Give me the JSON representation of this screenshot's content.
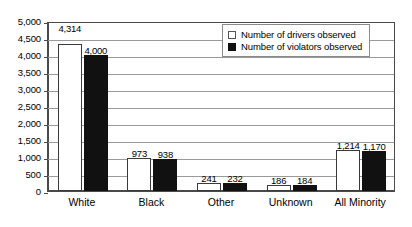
{
  "chart_data": {
    "type": "bar",
    "title": "",
    "subtitle": "",
    "xlabel": "",
    "ylabel": "",
    "categories": [
      "White",
      "Black",
      "Other",
      "Unknown",
      "All Minority"
    ],
    "series": [
      {
        "name": "Number of drivers observed",
        "swatch": "light",
        "values": [
          4314,
          973,
          241,
          186,
          1214
        ],
        "labels": [
          "4,314",
          "973",
          "241",
          "186",
          "1,214"
        ]
      },
      {
        "name": "Number of violators observed",
        "swatch": "dark",
        "values": [
          4000,
          938,
          232,
          184,
          1170
        ],
        "labels": [
          "4,000",
          "938",
          "232",
          "184",
          "1,170"
        ]
      }
    ],
    "ylim": [
      0,
      5000
    ],
    "ytick_step": 500,
    "yticks": [
      0,
      500,
      1000,
      1500,
      2000,
      2500,
      3000,
      3500,
      4000,
      4500,
      5000
    ],
    "ytick_labels": [
      "0",
      "500",
      "1,000",
      "1,500",
      "2,000",
      "2,500",
      "3,000",
      "3,500",
      "4,000",
      "4,500",
      "5,000"
    ],
    "grid": true,
    "grid_axis": "y",
    "legend_position": "top-right",
    "colors": {
      "drivers_fill": "#ffffff",
      "drivers_border": "#3a3a3a",
      "violators_fill": "#111111",
      "gridline": "#9a9a9a",
      "axis": "#4a4a4a",
      "text": "#000000",
      "background": "#ffffff"
    }
  }
}
